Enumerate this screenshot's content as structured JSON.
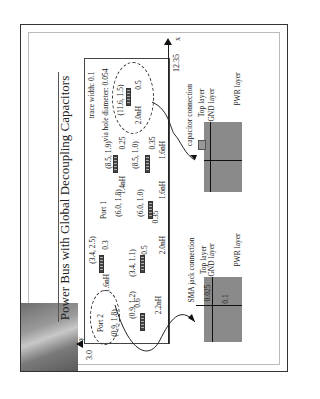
{
  "slide": {
    "title": "Power Bus with Global Decoupling Capacitors",
    "orientation": "rotated 90° counter-clockwise"
  },
  "board": {
    "axis_x_label": "x",
    "axis_x_max": "12.35",
    "axis_y_label": "y",
    "axis_y_max": "3.0",
    "notes": {
      "trace_width": "trace width: 0.1",
      "via_hole": "via hole diameter: 0.054"
    },
    "ports": [
      {
        "label": "Port 1",
        "coord": "(6.0, 1.8)"
      },
      {
        "label": "Port 2",
        "coord": "(0.9, 1.8)"
      }
    ],
    "capacitors": [
      {
        "coord": "(11.6, 1.5)",
        "spacing": "0.5",
        "inductance": "2.0nH"
      },
      {
        "coord": "(8.5, 1.9)",
        "spacing": "0.25",
        "inductance": "1.4nH"
      },
      {
        "coord": "(8.5, 1.0)",
        "spacing": "0.35",
        "inductance": "1.6nH"
      },
      {
        "coord": "(6.0, 1.0)",
        "spacing": "0.35",
        "inductance": "1.6nH"
      },
      {
        "coord": "(3.4, 2.5)",
        "spacing": "0.3",
        "inductance": "1.6nH"
      },
      {
        "coord": "(3.4, 1.1)",
        "spacing": "0.5",
        "inductance": "2.0nH"
      },
      {
        "coord": "(0.9, 1.2)",
        "spacing": "0.6",
        "inductance": "2.2nH"
      }
    ]
  },
  "capacitor_detail": {
    "title": "capacitor connection",
    "layers": [
      "Top layer",
      "GND layer",
      "PWR layer"
    ]
  },
  "sma_detail": {
    "title": "SMA jack connection",
    "layers": [
      "Top layer",
      "GND layer",
      "PWR layer"
    ],
    "dim_top": "0.025",
    "dim_total": "0.1"
  }
}
